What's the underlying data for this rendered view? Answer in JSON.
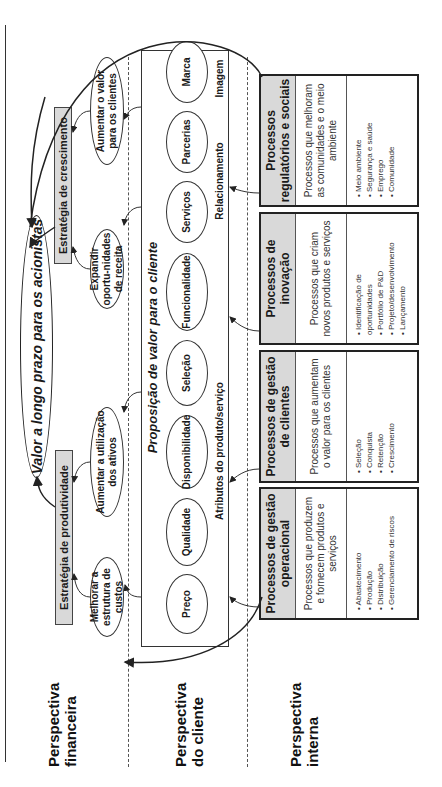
{
  "perspectives": [
    {
      "label": "Perspectiva financeira"
    },
    {
      "label": "Perspectiva do cliente"
    },
    {
      "label": "Perspectiva interna"
    }
  ],
  "financial": {
    "goal": "Valor a longo prazo para os acionistas",
    "strategies": [
      {
        "label": "Estratégia de produtividade",
        "objectives": [
          "Melhorar a estrutura de custos",
          "Aumentar a utilização dos ativos"
        ]
      },
      {
        "label": "Estratégia de crescimento",
        "objectives": [
          "Expandir oportu-nidades de receita",
          "Aumentar o valor para os clientes"
        ]
      }
    ]
  },
  "customer": {
    "title": "Proposição de valor para o cliente",
    "attributes": [
      "Preço",
      "Qualidade",
      "Disponibilidade",
      "Seleção",
      "Funcionalidade",
      "Serviços",
      "Parcerias",
      "Marca"
    ],
    "groups": [
      "Atributos do produto/serviço",
      "Relacionamento",
      "Imagem"
    ]
  },
  "internal": {
    "processes": [
      {
        "title": "Processos de gestão operacional",
        "description": "Processos que produzem e fornecem produtos e serviços",
        "items": [
          "Abastecimento",
          "Produção",
          "Distribuição",
          "Gerenciamento de riscos"
        ]
      },
      {
        "title": "Processos de gestão de clientes",
        "description": "Processos que aumentam o valor para os clientes",
        "items": [
          "Seleção",
          "Conquista",
          "Retenção",
          "Crescimento"
        ]
      },
      {
        "title": "Processos de inovação",
        "description": "Processos que criam novos produtos e serviços",
        "items": [
          "Identificação de oportunidades",
          "Portfólio de P&D",
          "Projeto/desenvolvimento",
          "Lançamento"
        ]
      },
      {
        "title": "Processos regulatórios e sociais",
        "description": "Processos que melhoram as comunidades e o meio ambiente",
        "items": [
          "Meio ambiente",
          "Segurança e saúde",
          "Emprego",
          "Comunidade"
        ]
      }
    ]
  },
  "colors": {
    "header_fill": "#d9d9d9",
    "line": "#222222"
  }
}
